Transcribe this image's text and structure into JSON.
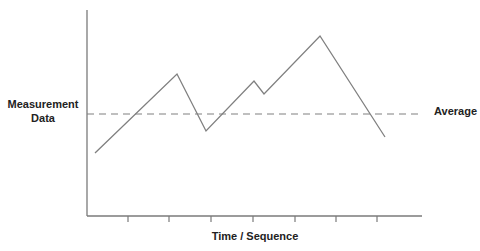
{
  "chart_data": {
    "type": "line",
    "title": "",
    "xlabel": "Time / Sequence",
    "ylabel": "Measurement Data",
    "ylabel_lines": [
      "Measurement",
      "Data"
    ],
    "grid": false,
    "legend": null,
    "x_tick_labels": [],
    "y_tick_labels": [],
    "x": [
      0,
      1.95,
      2.65,
      3.8,
      4.05,
      5.4,
      6.95
    ],
    "values": [
      28,
      66,
      38,
      62,
      56,
      84,
      36
    ],
    "ylim": [
      0,
      100
    ],
    "xlim": [
      -0.2,
      7.8
    ],
    "annotations": [
      {
        "type": "hline",
        "label": "Average",
        "value": 47,
        "style": "dashed"
      }
    ],
    "colors": {
      "line": "#808080",
      "axis": "#7a7a7a",
      "average": "#808080",
      "text": "#222222"
    }
  },
  "labels": {
    "y_line1": "Measurement",
    "y_line2": "Data",
    "x": "Time / Sequence",
    "average": "Average"
  },
  "render": {
    "plot": {
      "left": 87,
      "top": 10,
      "right": 422,
      "bottom": 216
    },
    "ticks_x_px": [
      128,
      169,
      211,
      253,
      295,
      336,
      377
    ],
    "points_px": [
      [
        95,
        153
      ],
      [
        177,
        74
      ],
      [
        206,
        131
      ],
      [
        254,
        81
      ],
      [
        264,
        94
      ],
      [
        320,
        36
      ],
      [
        385,
        137
      ]
    ],
    "average_y_px": 114,
    "average_x_end_px": 420
  }
}
